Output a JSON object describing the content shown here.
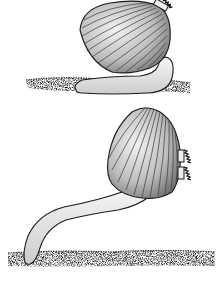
{
  "image": {
    "description": "Black and white illustration of two cockle bivalves showing foot movement",
    "background": "#ffffff",
    "ink": "#1a1a1a",
    "shell_fill": "#cfcfcf",
    "foot_fill": "#ececec",
    "sediment": "#3a3a3a"
  },
  "figures": [
    {
      "name": "cockle-top",
      "pose": "foot folded along sediment surface"
    },
    {
      "name": "cockle-bottom",
      "pose": "foot extended downward into sediment"
    }
  ]
}
